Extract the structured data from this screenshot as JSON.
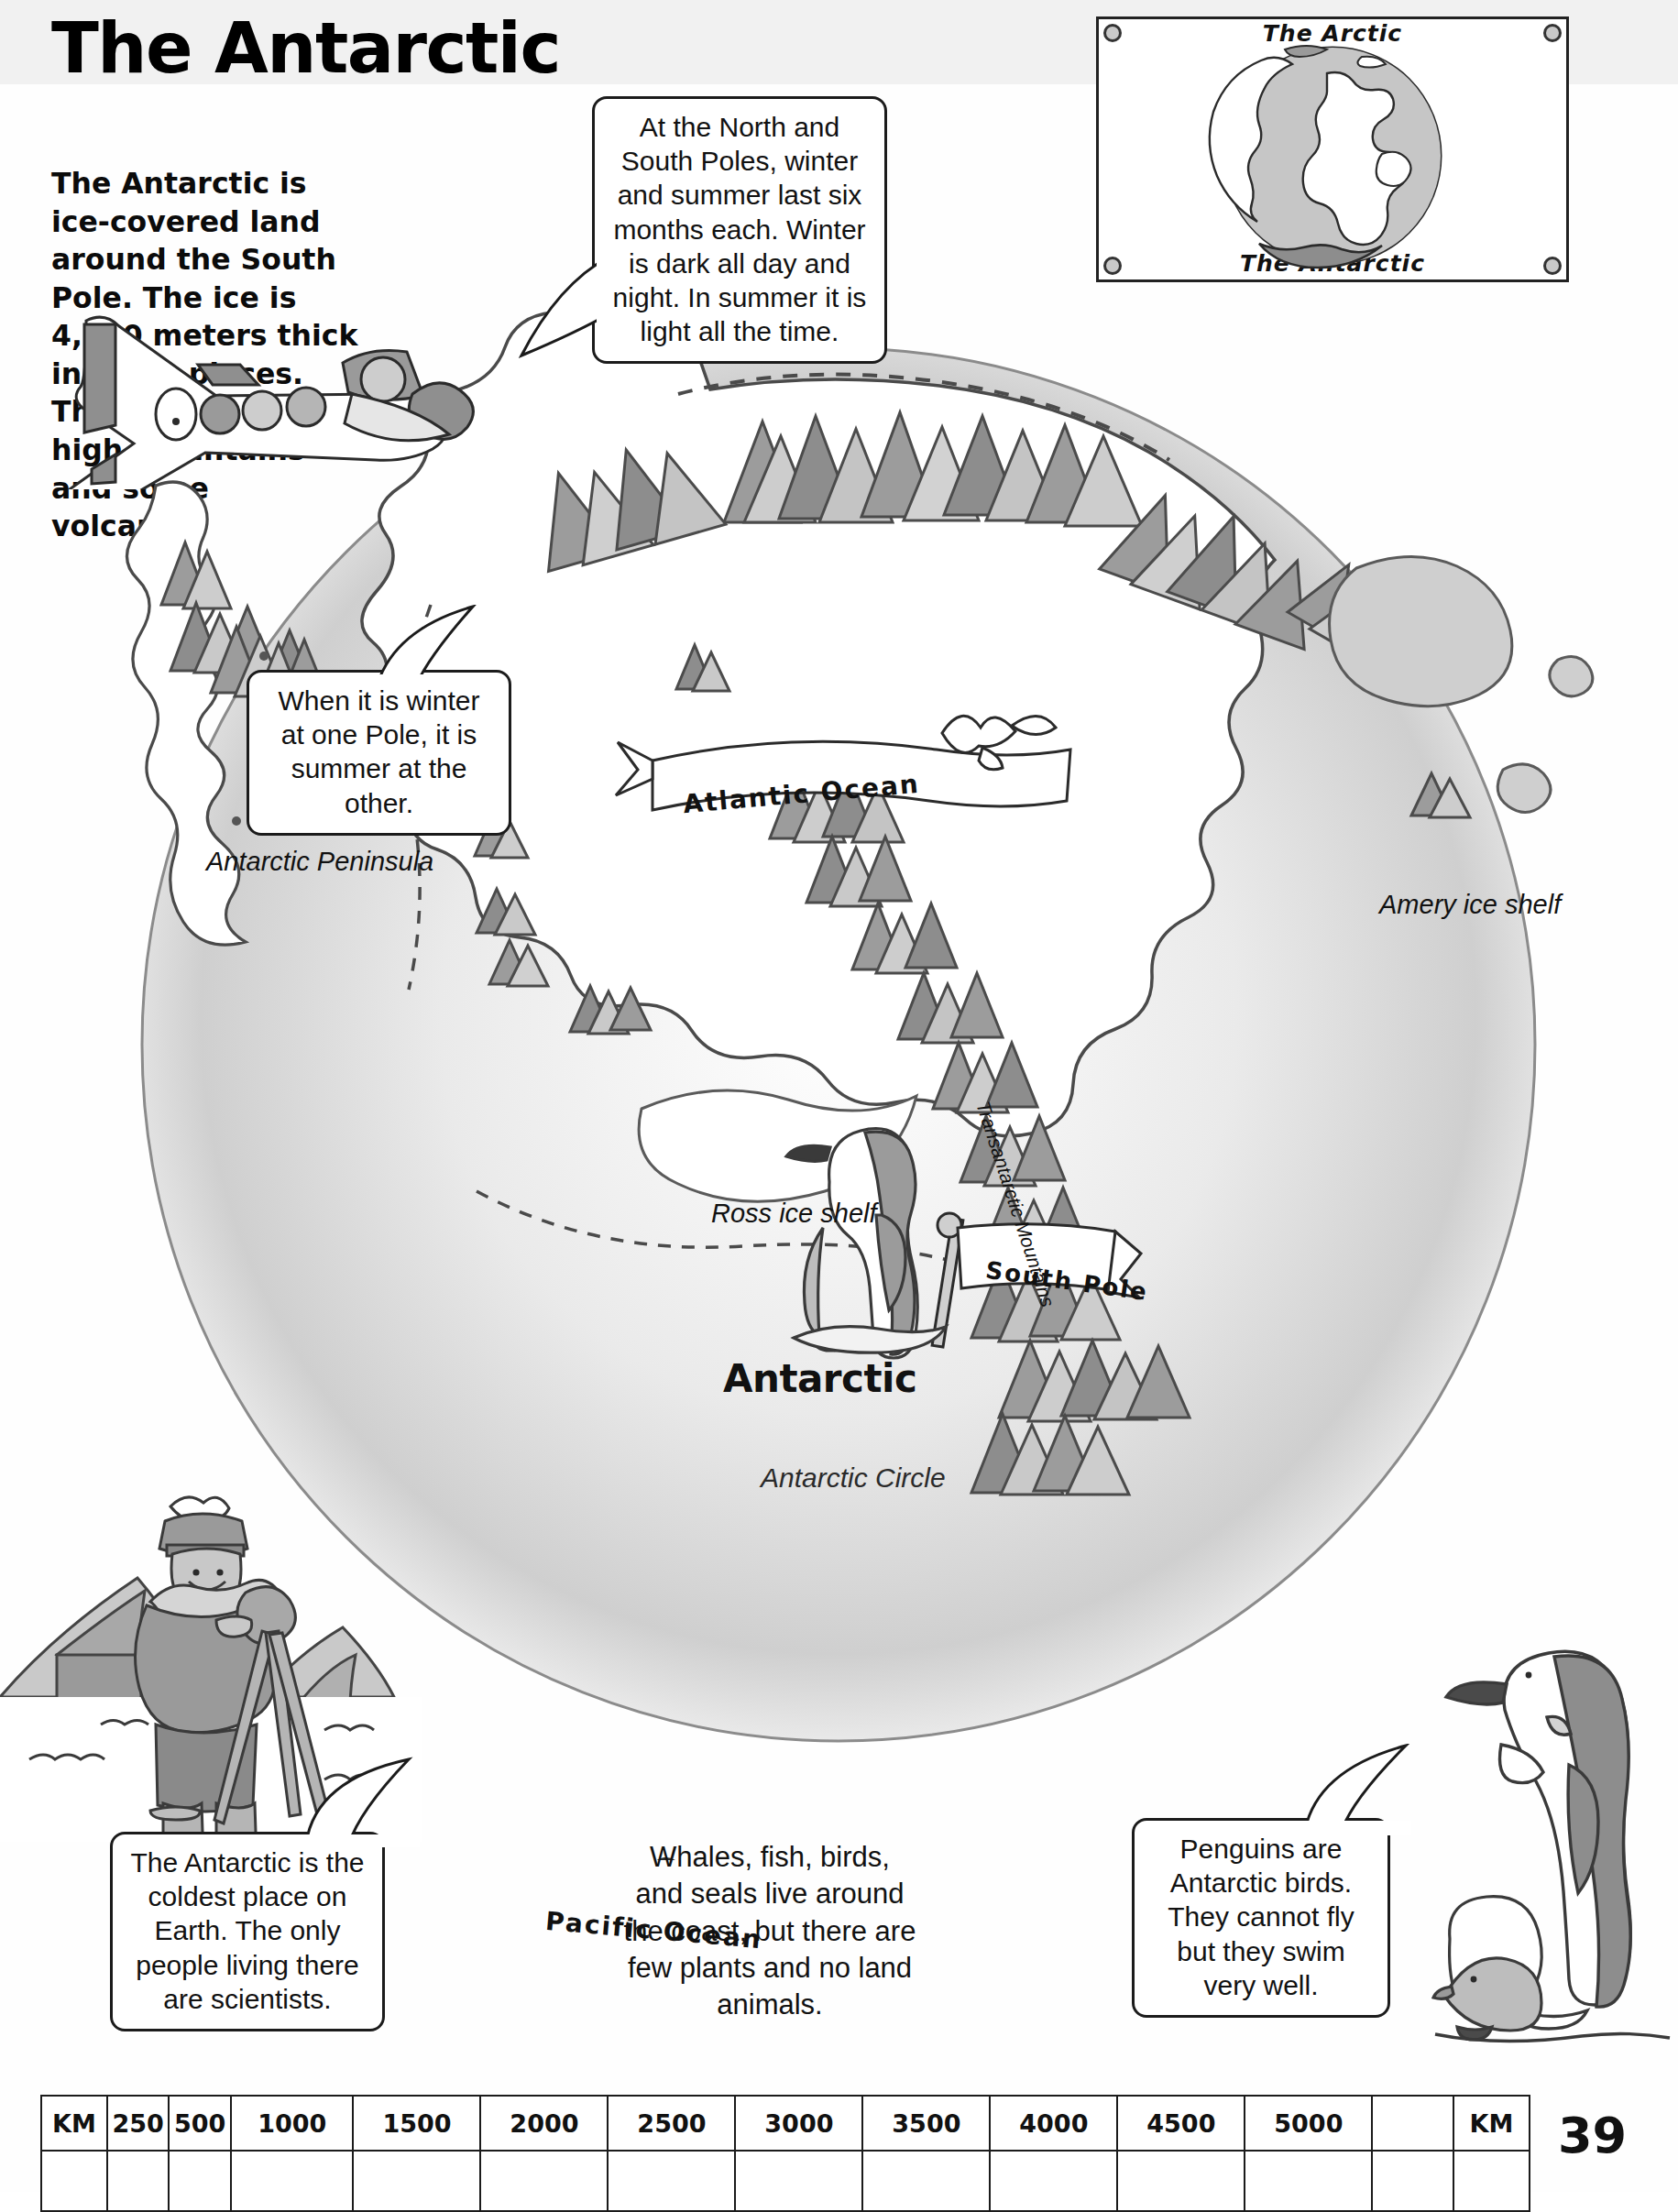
{
  "page": {
    "title": "The Antarctic",
    "page_number": "39",
    "intro_text": "The Antarctic is ice-covered land around the South Pole. The ice is 4,500 meters thick in some places. There are many high mountains and some volcanos."
  },
  "bubbles": {
    "poles": "At the North and South Poles, winter and summer last six months each. Winter is dark all day and night. In summer it is light all the time.",
    "seasons": "When it is winter at one Pole, it is summer at the other.",
    "coldest": "The Antarctic is the coldest place on Earth. The only people living there are scientists.",
    "penguins": "Penguins are Antarctic birds. They cannot fly but they swim very well.",
    "wildlife": "Whales, fish, birds, and seals live around the coast, but there are few plants and no land animals."
  },
  "globe_inset": {
    "top_label": "The Arctic",
    "bottom_label": "The Antarctic"
  },
  "map": {
    "continent_label": "Antarctic",
    "labels": {
      "peninsula": "Antarctic Peninsula",
      "amery": "Amery ice shelf",
      "ross": "Ross ice shelf",
      "transantarctic": "Transantarctic Mountains",
      "antarctic_circle": "Antarctic Circle"
    },
    "ribbons": {
      "atlantic": "Atlantic Ocean",
      "pacific": "Pacific Ocean",
      "south_pole": "South Pole"
    }
  },
  "scale_bar": {
    "cells": [
      "KM",
      "250",
      "500",
      "1000",
      "1500",
      "2000",
      "2500",
      "3000",
      "3500",
      "4000",
      "4500",
      "5000",
      "",
      "KM"
    ],
    "widths": [
      60,
      52,
      52,
      115,
      120,
      120,
      120,
      120,
      120,
      120,
      120,
      120,
      75,
      70
    ]
  },
  "colors": {
    "ink": "#1b1b1b",
    "ocean_grey": "#d8d8d8",
    "mountain_dark": "#8e8e8e",
    "mountain_mid": "#b3b3b3",
    "mountain_light": "#d5d5d5",
    "land_white": "#ffffff",
    "header_band": "#f1f1f1"
  }
}
